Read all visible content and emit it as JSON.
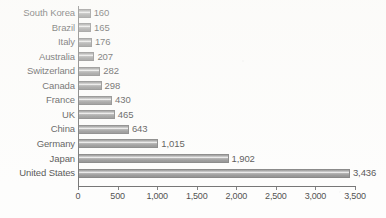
{
  "chart_data": {
    "type": "bar",
    "orientation": "horizontal",
    "title": "",
    "subtitle": "",
    "xlabel": "",
    "ylabel": "",
    "categories": [
      "South Korea",
      "Brazil",
      "Italy",
      "Australia",
      "Switzerland",
      "Canada",
      "France",
      "UK",
      "China",
      "Germany",
      "Japan",
      "United States"
    ],
    "values": [
      160,
      165,
      176,
      207,
      282,
      298,
      430,
      465,
      643,
      1015,
      1902,
      3436
    ],
    "value_labels": [
      "160",
      "165",
      "176",
      "207",
      "282",
      "298",
      "430",
      "465",
      "643",
      "1,015",
      "1,902",
      "3,436"
    ],
    "xlim": [
      0,
      3500
    ],
    "xticks": [
      0,
      500,
      1000,
      1500,
      2000,
      2500,
      3000,
      3500
    ],
    "xtick_labels": [
      "0",
      "500",
      "1,000",
      "1,500",
      "2,000",
      "2,500",
      "3,000",
      "3,500"
    ],
    "grid": false,
    "legend": null,
    "bar_color": "#808080",
    "axis_color": "#4a4a4a",
    "text_color": "#151515",
    "background_color": "#fdfdfc"
  }
}
